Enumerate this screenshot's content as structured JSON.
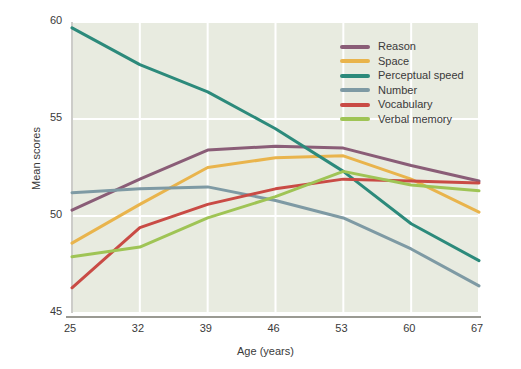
{
  "chart_data": {
    "type": "line",
    "title": "",
    "xlabel": "Age (years)",
    "ylabel": "Mean scores",
    "x": [
      25,
      32,
      39,
      46,
      53,
      60,
      67
    ],
    "xticks": [
      "25",
      "32",
      "39",
      "46",
      "53",
      "60",
      "67"
    ],
    "yticks": [
      "60",
      "55",
      "50",
      "45"
    ],
    "ylim": [
      45,
      60
    ],
    "xlim": [
      25,
      67
    ],
    "grid": true,
    "legend_position": "top-right",
    "series": [
      {
        "name": "Reason",
        "color": "#8a5d77",
        "values": [
          50.3,
          51.9,
          53.4,
          53.6,
          53.5,
          52.6,
          51.8
        ]
      },
      {
        "name": "Space",
        "color": "#e9b44c",
        "values": [
          48.6,
          50.6,
          52.5,
          53.0,
          53.1,
          51.9,
          50.2
        ]
      },
      {
        "name": "Perceptual speed",
        "color": "#2c8a7b",
        "values": [
          59.7,
          57.8,
          56.4,
          54.5,
          52.3,
          49.6,
          47.7
        ]
      },
      {
        "name": "Number",
        "color": "#7e9aa4",
        "values": [
          51.2,
          51.4,
          51.5,
          50.8,
          49.9,
          48.3,
          46.4
        ]
      },
      {
        "name": "Vocabulary",
        "color": "#c94b45",
        "values": [
          46.3,
          49.4,
          50.6,
          51.4,
          51.9,
          51.8,
          51.7
        ]
      },
      {
        "name": "Verbal memory",
        "color": "#9fc455",
        "values": [
          47.9,
          48.4,
          49.9,
          51.0,
          52.3,
          51.6,
          51.3
        ]
      }
    ]
  },
  "colors": {
    "plot_background": "#e8ebe0",
    "gridline": "#ffffff",
    "axis": "#9a9a93",
    "text": "#3a3a3a",
    "page_background": "#ffffff"
  }
}
